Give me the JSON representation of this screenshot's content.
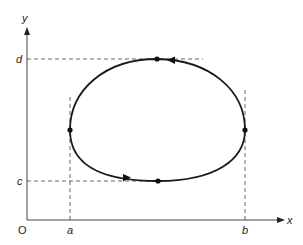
{
  "diagram": {
    "type": "closed-curve-bounding-box",
    "axes": {
      "x_label": "x",
      "y_label": "y",
      "origin_label": "O"
    },
    "bounds": {
      "x_min_label": "a",
      "x_max_label": "b",
      "y_min_label": "c",
      "y_max_label": "d"
    },
    "curve": {
      "description": "Closed oval curve traversed counter-clockwise, tangent to x=a, x=b, y=c, y=d",
      "marked_points": [
        "top (y=d)",
        "left (x=a)",
        "bottom (y=c)",
        "right (x=b)"
      ],
      "direction_arrows": [
        "top arrow pointing left",
        "bottom arrow pointing right"
      ]
    },
    "colors": {
      "stroke": "#1a1a1a",
      "dashed": "#555555",
      "axis": "#444444"
    }
  }
}
